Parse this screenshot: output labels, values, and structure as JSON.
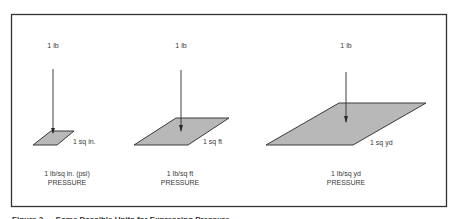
{
  "figure": {
    "caption": "Figure 2 — Some Possible Units for Expressing Pressure",
    "colors": {
      "border": "#333333",
      "fill": "#b8b8b8",
      "edge": "#3a3a3a",
      "text": "#3a3a3a"
    },
    "panels": [
      {
        "force_label": "1 lb",
        "area_label": "1 sq in.",
        "unit_label": "1 lb/sq in. (psi)",
        "quantity_label": "PRESSURE"
      },
      {
        "force_label": "1 lb",
        "area_label": "1 sq ft",
        "unit_label": "1 lb/sq ft",
        "quantity_label": "PRESSURE"
      },
      {
        "force_label": "1 lb",
        "area_label": "1 sq yd",
        "unit_label": "1 lb/sq yd",
        "quantity_label": "PRESSURE"
      }
    ]
  }
}
